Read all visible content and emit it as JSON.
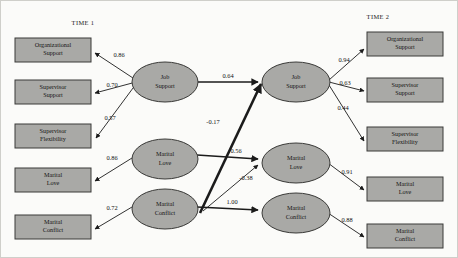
{
  "diagram": {
    "type": "path-diagram",
    "time_labels": {
      "time1": "TIME 1",
      "time2": "TIME 2"
    },
    "colors": {
      "node_fill": "#a9a9a6",
      "node_stroke": "#3a3a38",
      "path_stroke": "#1b1b1b",
      "background": "#fbfbf9"
    },
    "latent_variables": [
      {
        "id": "t1_job_support",
        "line1": "Job",
        "line2": "Support",
        "time": "TIME 1"
      },
      {
        "id": "t1_marital_love",
        "line1": "Marital",
        "line2": "Love",
        "time": "TIME 1"
      },
      {
        "id": "t1_marital_conflict",
        "line1": "Marital",
        "line2": "Conflict",
        "time": "TIME 1"
      },
      {
        "id": "t2_job_support",
        "line1": "Job",
        "line2": "Support",
        "time": "TIME 2"
      },
      {
        "id": "t2_marital_love",
        "line1": "Marital",
        "line2": "Love",
        "time": "TIME 2"
      },
      {
        "id": "t2_marital_conflict",
        "line1": "Marital",
        "line2": "Conflict",
        "time": "TIME 2"
      }
    ],
    "indicators_time1": [
      {
        "id": "t1_ind_org_support",
        "line1": "Organizational",
        "line2": "Support"
      },
      {
        "id": "t1_ind_sup_support",
        "line1": "Supervisor",
        "line2": "Support"
      },
      {
        "id": "t1_ind_sup_flex",
        "line1": "Supervisor",
        "line2": "Flexibility"
      },
      {
        "id": "t1_ind_marital_love",
        "line1": "Marital",
        "line2": "Love"
      },
      {
        "id": "t1_ind_marital_conf",
        "line1": "Marital",
        "line2": "Conflict"
      }
    ],
    "indicators_time2": [
      {
        "id": "t2_ind_org_support",
        "line1": "Organizational",
        "line2": "Support"
      },
      {
        "id": "t2_ind_sup_support",
        "line1": "Supervisor",
        "line2": "Support"
      },
      {
        "id": "t2_ind_sup_flex",
        "line1": "Supervisor",
        "line2": "Flexibility"
      },
      {
        "id": "t2_ind_marital_love",
        "line1": "Marital",
        "line2": "Love"
      },
      {
        "id": "t2_ind_marital_conf",
        "line1": "Marital",
        "line2": "Conflict"
      }
    ],
    "coefficients": {
      "t1_js_to_org_support": "0.86",
      "t1_js_to_sup_support": "0.70",
      "t1_js_to_sup_flex": "0.57",
      "t1_ml_to_marital_love": "0.86",
      "t1_mc_to_marital_conf": "0.72",
      "t2_js_to_org_support": "0.94",
      "t2_js_to_sup_support": "0.63",
      "t2_js_to_sup_flex": "0.44",
      "t2_ml_to_marital_love": "0.91",
      "t2_mc_to_marital_conf": "0.88",
      "js_t1_to_js_t2": "0.64",
      "mc_t1_to_js_t2": "-0.17",
      "ml_t1_to_ml_t2": "0.56",
      "mc_t1_to_ml_t2": "-0.38",
      "mc_t1_to_mc_t2": "1.00"
    }
  }
}
